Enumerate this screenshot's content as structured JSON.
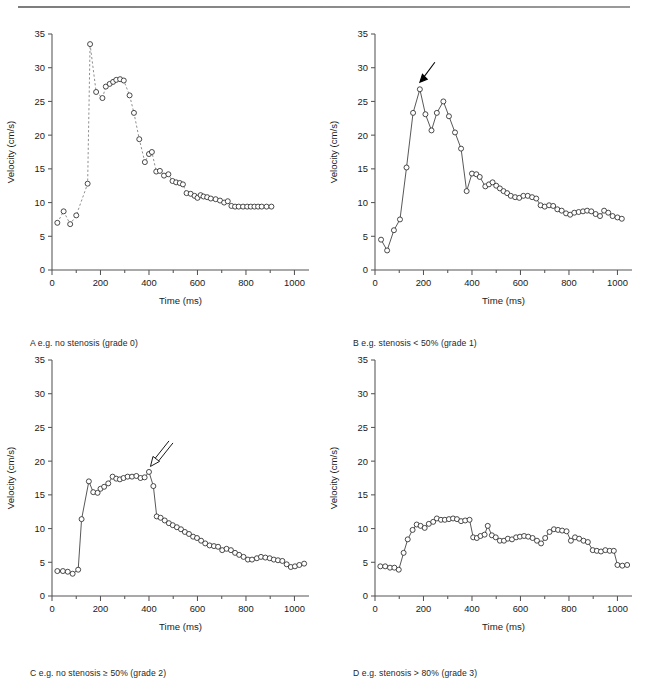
{
  "figure": {
    "top_rule": true,
    "caption": ""
  },
  "axes": {
    "xlabel": "Time (ms)",
    "ylabel": "Velocity (cm/s)",
    "xticks": [
      0,
      200,
      400,
      600,
      800,
      1000
    ],
    "yticks": [
      0,
      5,
      10,
      15,
      20,
      25,
      30,
      35
    ],
    "xlim": [
      0,
      1060
    ],
    "ylim": [
      0,
      35
    ],
    "xminor_step": 100,
    "grid": false
  },
  "panels": {
    "a": {
      "letter": "A",
      "caption": "A  e.g. no stenosis (grade 0)"
    },
    "b": {
      "letter": "B",
      "caption": "B  e.g. stenosis < 50% (grade 1)"
    },
    "c": {
      "letter": "C",
      "caption": "C  e.g. no stenosis ≥ 50% (grade 2)"
    },
    "d": {
      "letter": "D",
      "caption": "D  e.g. stenosis > 80% (grade 3)"
    }
  },
  "annotations": {
    "panel_b_arrow": {
      "name": "peak-systolic-arrow",
      "style": "solid",
      "points_to_x": 185,
      "points_to_y": 26.8
    },
    "panel_c_arrow": {
      "name": "damped-peak-arrow",
      "style": "open",
      "points_to_x": 400,
      "points_to_y": 18.4
    }
  },
  "chart_data": [
    {
      "id": "panel-a",
      "type": "scatter",
      "title": "A  e.g. no stenosis (grade 0)",
      "xlabel": "Time (ms)",
      "ylabel": "Velocity (cm/s)",
      "xlim": [
        0,
        1060
      ],
      "ylim": [
        0,
        35
      ],
      "line_style": "dashed",
      "marker": "open-circle",
      "grid": false,
      "x": [
        22,
        48,
        75,
        100,
        147,
        157,
        182,
        208,
        222,
        238,
        252,
        265,
        281,
        296,
        320,
        338,
        360,
        383,
        400,
        412,
        430,
        445,
        462,
        480,
        497,
        512,
        527,
        540,
        555,
        572,
        588,
        600,
        613,
        625,
        640,
        655,
        675,
        693,
        710,
        725,
        740,
        755,
        770,
        788,
        805,
        820,
        835,
        850,
        865,
        885,
        905
      ],
      "y": [
        7.0,
        8.7,
        6.8,
        8.1,
        12.8,
        33.5,
        26.4,
        25.5,
        27.2,
        27.6,
        27.9,
        28.2,
        28.3,
        28.1,
        25.9,
        23.3,
        19.4,
        16.0,
        17.2,
        17.5,
        14.6,
        14.7,
        14.0,
        14.2,
        13.2,
        13.0,
        12.9,
        12.7,
        11.4,
        11.3,
        11.0,
        10.7,
        11.1,
        10.9,
        10.8,
        10.6,
        10.5,
        10.3,
        10.0,
        10.2,
        9.5,
        9.4,
        9.4,
        9.4,
        9.4,
        9.4,
        9.4,
        9.4,
        9.4,
        9.4,
        9.4
      ]
    },
    {
      "id": "panel-b",
      "type": "scatter",
      "title": "B  e.g. stenosis < 50% (grade 1)",
      "xlabel": "Time (ms)",
      "ylabel": "Velocity (cm/s)",
      "xlim": [
        0,
        1060
      ],
      "ylim": [
        0,
        35
      ],
      "line_style": "solid",
      "marker": "open-circle",
      "grid": false,
      "x": [
        25,
        50,
        78,
        103,
        130,
        157,
        185,
        208,
        233,
        255,
        282,
        305,
        330,
        355,
        378,
        400,
        418,
        432,
        455,
        470,
        485,
        500,
        515,
        530,
        545,
        560,
        578,
        595,
        612,
        630,
        648,
        665,
        683,
        700,
        718,
        735,
        752,
        770,
        788,
        805,
        822,
        840,
        858,
        875,
        892,
        910,
        928,
        945,
        962,
        980,
        1000,
        1018
      ],
      "y": [
        4.5,
        2.9,
        5.9,
        7.5,
        15.2,
        23.3,
        26.8,
        23.1,
        20.7,
        23.3,
        25.0,
        22.8,
        20.4,
        18.0,
        11.7,
        14.3,
        14.2,
        13.8,
        12.4,
        12.7,
        13.0,
        12.5,
        12.1,
        11.7,
        11.4,
        11.0,
        10.8,
        10.7,
        11.0,
        11.0,
        10.8,
        10.6,
        9.6,
        9.4,
        9.6,
        9.5,
        9.0,
        8.8,
        8.4,
        8.2,
        8.5,
        8.6,
        8.7,
        8.8,
        8.7,
        8.3,
        8.0,
        8.8,
        8.5,
        8.0,
        7.8,
        7.6
      ]
    },
    {
      "id": "panel-c",
      "type": "scatter",
      "title": "C  e.g. no stenosis ≥ 50% (grade 2)",
      "xlabel": "Time (ms)",
      "ylabel": "Velocity (cm/s)",
      "xlim": [
        0,
        1060
      ],
      "ylim": [
        0,
        35
      ],
      "line_style": "solid",
      "marker": "open-circle",
      "grid": false,
      "x": [
        22,
        45,
        65,
        85,
        108,
        122,
        152,
        170,
        188,
        200,
        215,
        232,
        250,
        265,
        280,
        295,
        312,
        330,
        348,
        365,
        382,
        400,
        418,
        432,
        448,
        465,
        482,
        498,
        515,
        532,
        548,
        565,
        582,
        598,
        615,
        632,
        650,
        668,
        685,
        702,
        720,
        738,
        755,
        772,
        790,
        808,
        825,
        845,
        862,
        880,
        898,
        915,
        932,
        950,
        968,
        985,
        1002,
        1020,
        1040
      ],
      "y": [
        3.7,
        3.7,
        3.6,
        3.3,
        3.9,
        11.4,
        17.0,
        15.4,
        15.3,
        15.9,
        16.2,
        16.7,
        17.7,
        17.4,
        17.3,
        17.5,
        17.7,
        17.7,
        17.8,
        17.5,
        17.6,
        18.4,
        16.3,
        11.8,
        11.6,
        11.2,
        10.8,
        10.5,
        10.2,
        9.9,
        9.5,
        9.2,
        8.8,
        8.6,
        8.2,
        7.8,
        7.5,
        7.4,
        7.3,
        6.8,
        7.0,
        6.8,
        6.4,
        6.1,
        5.8,
        5.4,
        5.4,
        5.6,
        5.8,
        5.7,
        5.6,
        5.4,
        5.3,
        5.2,
        4.7,
        4.3,
        4.4,
        4.6,
        4.8
      ]
    },
    {
      "id": "panel-d",
      "type": "scatter",
      "title": "D  e.g. stenosis > 80% (grade 3)",
      "xlabel": "Time (ms)",
      "ylabel": "Velocity (cm/s)",
      "xlim": [
        0,
        1060
      ],
      "ylim": [
        0,
        35
      ],
      "line_style": "solid",
      "marker": "open-circle",
      "grid": false,
      "x": [
        22,
        42,
        62,
        80,
        98,
        118,
        135,
        155,
        172,
        188,
        205,
        222,
        240,
        255,
        272,
        288,
        305,
        322,
        338,
        355,
        372,
        390,
        405,
        420,
        435,
        452,
        465,
        482,
        498,
        515,
        532,
        548,
        565,
        582,
        598,
        615,
        632,
        650,
        668,
        685,
        702,
        720,
        738,
        755,
        772,
        790,
        808,
        825,
        842,
        860,
        878,
        898,
        915,
        932,
        950,
        968,
        985,
        1000,
        1020,
        1040
      ],
      "y": [
        4.4,
        4.4,
        4.2,
        4.2,
        3.9,
        6.4,
        8.4,
        9.8,
        10.6,
        10.4,
        10.1,
        10.7,
        11.0,
        11.5,
        11.3,
        11.3,
        11.4,
        11.5,
        11.4,
        11.1,
        11.2,
        11.3,
        8.7,
        8.6,
        8.9,
        9.1,
        10.4,
        9.0,
        8.7,
        8.2,
        8.2,
        8.5,
        8.4,
        8.7,
        8.8,
        8.9,
        8.8,
        8.6,
        8.2,
        7.8,
        8.6,
        9.5,
        9.9,
        9.8,
        9.7,
        9.6,
        8.2,
        8.7,
        8.5,
        8.2,
        8.0,
        6.8,
        6.7,
        6.6,
        6.8,
        6.7,
        6.7,
        4.6,
        4.5,
        4.6
      ]
    }
  ]
}
